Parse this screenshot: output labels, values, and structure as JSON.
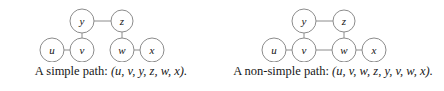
{
  "figure": {
    "background_color": "#ffffff",
    "stroke_color": "#8c8c8c",
    "text_color": "#171717"
  },
  "panels": [
    {
      "id": "simple-path",
      "caption_prefix": "A simple path: ",
      "caption_sequence": "(u, v, y, z, w, x).",
      "caption_full": "A simple path: (u, v, y, z, w, x).",
      "path_vertices": [
        "u",
        "v",
        "y",
        "z",
        "w",
        "x"
      ],
      "graph": {
        "nodes": [
          {
            "id": "u",
            "label": "u",
            "cx": 52,
            "cy": 48,
            "r": 12
          },
          {
            "id": "v",
            "label": "v",
            "cx": 82,
            "cy": 48,
            "r": 12
          },
          {
            "id": "w",
            "label": "w",
            "cx": 122,
            "cy": 48,
            "r": 12
          },
          {
            "id": "x",
            "label": "x",
            "cx": 152,
            "cy": 48,
            "r": 12
          },
          {
            "id": "y",
            "label": "y",
            "cx": 82,
            "cy": 19,
            "r": 12
          },
          {
            "id": "z",
            "label": "z",
            "cx": 122,
            "cy": 19,
            "r": 11
          }
        ],
        "edges": [
          {
            "from": "u",
            "to": "v"
          },
          {
            "from": "v",
            "to": "y"
          },
          {
            "from": "y",
            "to": "z"
          },
          {
            "from": "z",
            "to": "w"
          },
          {
            "from": "w",
            "to": "x"
          }
        ]
      }
    },
    {
      "id": "non-simple-path",
      "caption_prefix": "A non-simple path: ",
      "caption_sequence": "(u, v, w, z, y, v, w, x).",
      "caption_full": "A non-simple path: (u, v, w, z, y, v, w, x).",
      "path_vertices": [
        "u",
        "v",
        "w",
        "z",
        "y",
        "v",
        "w",
        "x"
      ],
      "graph": {
        "nodes": [
          {
            "id": "u",
            "label": "u",
            "cx": 52,
            "cy": 48,
            "r": 12
          },
          {
            "id": "v",
            "label": "v",
            "cx": 82,
            "cy": 48,
            "r": 12
          },
          {
            "id": "w",
            "label": "w",
            "cx": 122,
            "cy": 48,
            "r": 12
          },
          {
            "id": "x",
            "label": "x",
            "cx": 152,
            "cy": 48,
            "r": 12
          },
          {
            "id": "y",
            "label": "y",
            "cx": 82,
            "cy": 19,
            "r": 12
          },
          {
            "id": "z",
            "label": "z",
            "cx": 122,
            "cy": 19,
            "r": 11
          }
        ],
        "edges": [
          {
            "from": "u",
            "to": "v"
          },
          {
            "from": "v",
            "to": "y"
          },
          {
            "from": "y",
            "to": "z"
          },
          {
            "from": "z",
            "to": "w"
          },
          {
            "from": "w",
            "to": "x"
          },
          {
            "from": "v",
            "to": "w"
          }
        ]
      }
    }
  ]
}
